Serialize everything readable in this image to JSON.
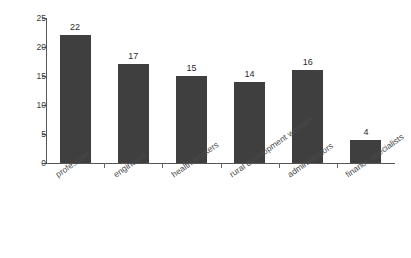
{
  "chart_data": {
    "type": "bar",
    "title": "",
    "subtitle": "",
    "xlabel": "",
    "ylabel": "percent",
    "ylim": [
      0,
      25
    ],
    "yticks": [
      0,
      5,
      10,
      15,
      20,
      25
    ],
    "ytick_labels": [
      "0",
      "5",
      "10",
      "15",
      "20",
      "25"
    ],
    "grid": false,
    "legend": false,
    "legend_position": "none",
    "bar_color": "#3f3f3f",
    "axis_color": "#555555",
    "value_label_color": "#2b2b2b",
    "category_label_rotation": -35,
    "categories": [
      "professors",
      "engineers",
      "health workers",
      "rural development workers",
      "administrators",
      "finance specialists"
    ],
    "values": [
      22,
      17,
      15,
      14,
      16,
      4
    ],
    "value_labels": [
      "22",
      "17",
      "15",
      "14",
      "16",
      "4"
    ]
  }
}
